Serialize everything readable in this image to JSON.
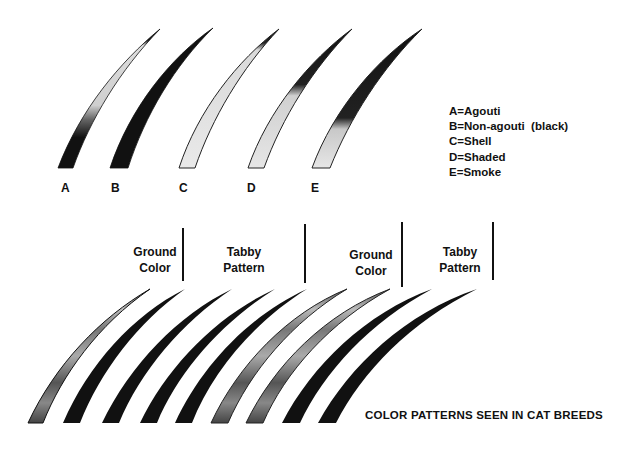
{
  "figure": {
    "title": "COLOR PATTERNS SEEN IN CAT BREEDS"
  },
  "top_row": {
    "hairs": [
      {
        "label": "A",
        "name": "Agouti",
        "pattern": "agouti"
      },
      {
        "label": "B",
        "name": "Non-agouti (black)",
        "pattern": "solid"
      },
      {
        "label": "C",
        "name": "Shell",
        "pattern": "shell"
      },
      {
        "label": "D",
        "name": "Shaded",
        "pattern": "shaded"
      },
      {
        "label": "E",
        "name": "Smoke",
        "pattern": "smoke"
      }
    ]
  },
  "legend": {
    "items": [
      "A=Agouti",
      "B=Non-agouti  (black)",
      "C=Shell",
      "D=Shaded",
      "E=Smoke"
    ]
  },
  "bottom_row": {
    "sections": [
      {
        "line1": "Ground",
        "line2": "Color"
      },
      {
        "line1": "Tabby",
        "line2": "Pattern"
      },
      {
        "line1": "Ground",
        "line2": "Color"
      },
      {
        "line1": "Tabby",
        "line2": "Pattern"
      }
    ],
    "hair_count": 9
  },
  "colors": {
    "ink": "#111111",
    "light_shaft": "#e6e6e6",
    "background": "#ffffff"
  }
}
